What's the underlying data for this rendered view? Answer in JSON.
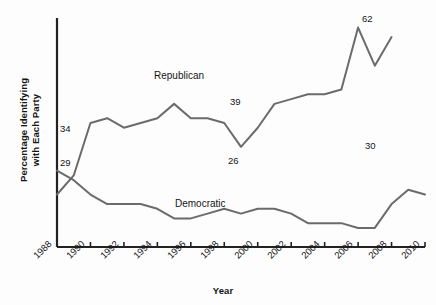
{
  "chart_data": {
    "type": "line",
    "title": "",
    "xlabel": "Year",
    "ylabel": "Percentage Identifying with Each Party",
    "ylabel_line1": "Percentage Identifying",
    "ylabel_line2": "with Each Party",
    "xlim": [
      1988,
      2010
    ],
    "ylim": [
      18,
      66
    ],
    "grid": false,
    "legend_position": "inline-annotations",
    "axis_color": "#222222",
    "line_color": "#6b6b6b",
    "background_color": "#fdfdfd",
    "x_ticks": [
      "1988",
      "1990",
      "1992",
      "1994",
      "1996",
      "1998",
      "2000",
      "2002",
      "2004",
      "2006",
      "2008",
      "2010"
    ],
    "x_tick_values": [
      1988,
      1990,
      1992,
      1994,
      1996,
      1998,
      2000,
      2002,
      2004,
      2006,
      2008,
      2010
    ],
    "y_ticks": [],
    "series": [
      {
        "name": "Republican",
        "label_text": "Republican",
        "x": [
          1988,
          1989,
          1990,
          1991,
          1992,
          1993,
          1994,
          1995,
          1996,
          1997,
          1998,
          1999,
          2000,
          2001,
          2002,
          2003,
          2004,
          2005,
          2006,
          2007,
          2008
        ],
        "values": [
          29,
          33,
          44,
          45,
          43,
          44,
          45,
          48,
          45,
          45,
          44,
          39,
          43,
          48,
          49,
          50,
          50,
          51,
          64,
          56,
          62
        ],
        "endpoint_labels": [
          {
            "x": 1988,
            "value": 29,
            "text": "29"
          },
          {
            "x": 1999,
            "value": 39,
            "text": "39"
          },
          {
            "x": 2008,
            "value": 62,
            "text": "62"
          }
        ]
      },
      {
        "name": "Democratic",
        "label_text": "Democratic",
        "x": [
          1988,
          1989,
          1990,
          1991,
          1992,
          1993,
          1994,
          1995,
          1996,
          1997,
          1998,
          1999,
          2000,
          2001,
          2002,
          2003,
          2004,
          2005,
          2006,
          2007,
          2008,
          2009,
          2010
        ],
        "values": [
          34,
          32,
          29,
          27,
          27,
          27,
          26,
          24,
          24,
          25,
          26,
          25,
          26,
          26,
          25,
          23,
          23,
          23,
          22,
          22,
          27,
          30,
          29
        ],
        "endpoint_labels": [
          {
            "x": 1988,
            "value": 34,
            "text": "34"
          },
          {
            "x": 2000,
            "value": 26,
            "text": "26"
          },
          {
            "x": 2009,
            "value": 30,
            "text": "30"
          }
        ]
      }
    ],
    "annotations": [
      {
        "text": "Republican",
        "kind": "series-name"
      },
      {
        "text": "Democratic",
        "kind": "series-name"
      },
      {
        "text": "34",
        "kind": "value"
      },
      {
        "text": "29",
        "kind": "value"
      },
      {
        "text": "39",
        "kind": "value"
      },
      {
        "text": "26",
        "kind": "value"
      },
      {
        "text": "62",
        "kind": "value"
      },
      {
        "text": "30",
        "kind": "value"
      }
    ]
  }
}
